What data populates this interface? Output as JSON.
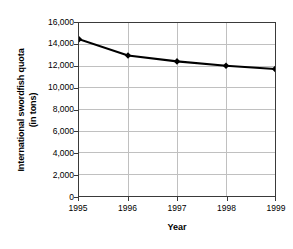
{
  "chart_data": {
    "type": "line",
    "title": "",
    "xlabel": "Year",
    "ylabel": "International swordfish quota (in tons)",
    "ylabel_lines": [
      "International swordfish quota",
      "(in tons)"
    ],
    "categories": [
      "1995",
      "1996",
      "1997",
      "1998",
      "1999"
    ],
    "values": [
      14500,
      13000,
      12450,
      12050,
      11750
    ],
    "series": [
      {
        "name": "International swordfish quota",
        "values": [
          14500,
          13000,
          12450,
          12050,
          11750
        ]
      }
    ],
    "ylim": [
      0,
      16000
    ],
    "y_ticks": [
      0,
      2000,
      4000,
      6000,
      8000,
      10000,
      12000,
      14000,
      16000
    ],
    "y_tick_labels": [
      "0",
      "2,000",
      "4,000",
      "6,000",
      "8,000",
      "10,000",
      "12,000",
      "14,000",
      "16,000"
    ],
    "x_tick_labels": [
      "1995",
      "1996",
      "1997",
      "1998",
      "1999"
    ],
    "grid": true,
    "grid_axes": "both",
    "legend": "none",
    "marker": "filled-diamond",
    "colors": {
      "line": "#000000",
      "marker": "#000000",
      "grid": "#bfbfbf",
      "axis": "#3a3a3a",
      "background": "#ffffff",
      "text": "#000000"
    }
  }
}
